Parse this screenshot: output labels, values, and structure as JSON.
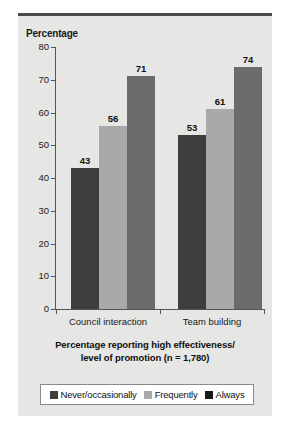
{
  "figure": {
    "y_axis_title": "Percentage",
    "caption_line1": "Percentage reporting high effectiveness/",
    "caption_line2": "level of promotion (n = 1,780)"
  },
  "colors": {
    "panel_bg": "#e6e6e4",
    "top_rule": "#4a4a4a",
    "axis": "#555555",
    "series_never": "#3d3d3d",
    "series_frequently": "#a9a9a9",
    "series_always": "#6b6b6b",
    "legend_swatch_never": "#3d3d3d",
    "legend_swatch_frequently": "#a9a9a9",
    "legend_swatch_always": "#1a1a1a",
    "legend_bg": "#ffffff",
    "legend_border": "#8a8a8a"
  },
  "chart_data": {
    "type": "bar",
    "title": "",
    "subtitle": "",
    "xlabel": "",
    "ylabel": "Percentage",
    "ylim": [
      0,
      80
    ],
    "yticks": [
      0,
      10,
      20,
      30,
      40,
      50,
      60,
      70,
      80
    ],
    "ytick_labels": [
      "0",
      "10",
      "20",
      "30",
      "40",
      "50",
      "60",
      "70",
      "80"
    ],
    "grid": false,
    "legend_position": "bottom",
    "categories": [
      "Council interaction",
      "Team building"
    ],
    "series": [
      {
        "name": "Never/occasionally",
        "values": [
          43,
          53
        ],
        "color": "#3d3d3d"
      },
      {
        "name": "Frequently",
        "values": [
          56,
          61
        ],
        "color": "#a9a9a9"
      },
      {
        "name": "Always",
        "values": [
          71,
          74
        ],
        "color": "#6b6b6b"
      }
    ],
    "data_labels": [
      [
        "43",
        "56",
        "71"
      ],
      [
        "53",
        "61",
        "74"
      ]
    ],
    "annotation": "Percentage reporting high effectiveness/ level of promotion (n = 1,780)"
  }
}
